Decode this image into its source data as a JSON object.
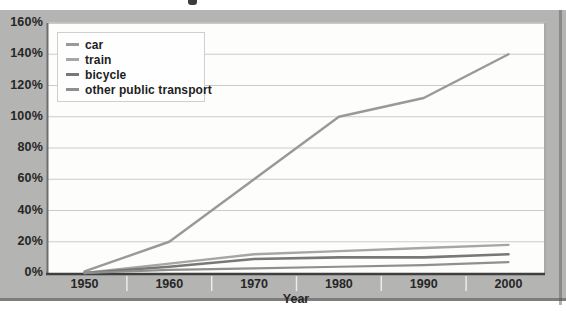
{
  "chart_data": {
    "type": "line",
    "x": [
      1950,
      1960,
      1970,
      1980,
      1990,
      2000
    ],
    "x_labels": [
      "1950",
      "1960",
      "1970",
      "1980",
      "1990",
      "2000"
    ],
    "xlabel": "Year",
    "ylim": [
      0,
      160
    ],
    "ytick_step": 20,
    "ytick_labels": [
      "0%",
      "20%",
      "40%",
      "60%",
      "80%",
      "100%",
      "120%",
      "140%",
      "160%"
    ],
    "grid": "horizontal",
    "legend_position": "top-left",
    "series": [
      {
        "name": "car",
        "color": "#999999",
        "width": 2.4,
        "values": [
          1,
          20,
          60,
          100,
          112,
          140
        ]
      },
      {
        "name": "train",
        "color": "#a6a6a6",
        "width": 2.4,
        "values": [
          0,
          6,
          12,
          14,
          16,
          18
        ]
      },
      {
        "name": "bicycle",
        "color": "#787878",
        "width": 2.6,
        "values": [
          0,
          4,
          9,
          10,
          10,
          12
        ]
      },
      {
        "name": "other public transport",
        "color": "#8f8f8f",
        "width": 2.2,
        "values": [
          0,
          2,
          3,
          4,
          5,
          7
        ]
      }
    ],
    "colors": {
      "panel_background": "#b4b4b3",
      "plot_background": "#fdfdfc",
      "gridline": "#cbcbcb",
      "axis_line": "#3f3f3f",
      "tick_label": "#262626"
    }
  },
  "artifacts": {
    "bleed_text": "ding graphs, tables and charts"
  }
}
